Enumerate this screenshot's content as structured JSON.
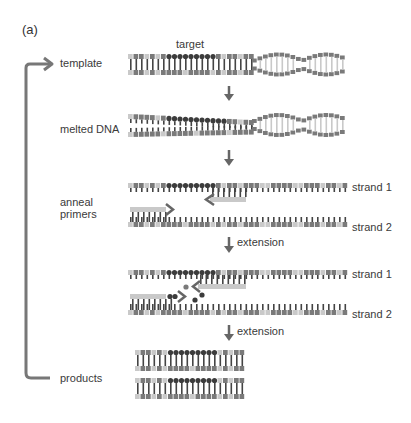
{
  "panel_label": "(a)",
  "target_label": "target",
  "steps": [
    {
      "id": "template",
      "label": "template"
    },
    {
      "id": "melted",
      "label": "melted DNA"
    },
    {
      "id": "anneal",
      "label": "anneal\nprimers",
      "label_line1": "anneal",
      "label_line2": "primers"
    },
    {
      "id": "extension1",
      "label": "extension"
    },
    {
      "id": "products",
      "label": "products"
    }
  ],
  "arrow_labels": {
    "extension_1": "extension",
    "extension_2": "extension"
  },
  "strand_labels": {
    "strand1_a": "strand 1",
    "strand2_a": "strand 2",
    "strand1_b": "strand 1",
    "strand2_b": "strand 2"
  },
  "colors": {
    "backbone_dark": "#7a7a7a",
    "backbone_light": "#c9c9c9",
    "target_dark": "#3c3c3c",
    "rung": "#444444",
    "arrow": "#666666",
    "text": "#333333"
  }
}
